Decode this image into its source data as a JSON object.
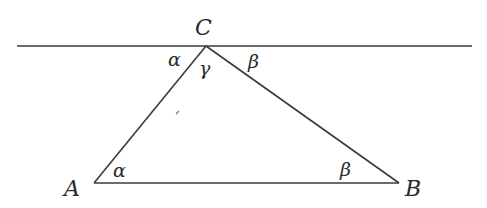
{
  "diagram": {
    "type": "geometry-triangle-parallel-line",
    "line": {
      "x1": 17,
      "y1": 46,
      "x2": 472,
      "y2": 46
    },
    "vertices": {
      "A": {
        "x": 94,
        "y": 183
      },
      "B": {
        "x": 399,
        "y": 183
      },
      "C": {
        "x": 206,
        "y": 46
      }
    },
    "labels": {
      "A": "A",
      "B": "B",
      "C": "C",
      "alpha_top": "α",
      "gamma": "γ",
      "beta_top": "β",
      "alpha_bottom": "α",
      "beta_bottom": "β"
    },
    "colors": {
      "stroke": "#3a3a3a",
      "text": "#2a2a2a",
      "background": "#ffffff"
    }
  }
}
